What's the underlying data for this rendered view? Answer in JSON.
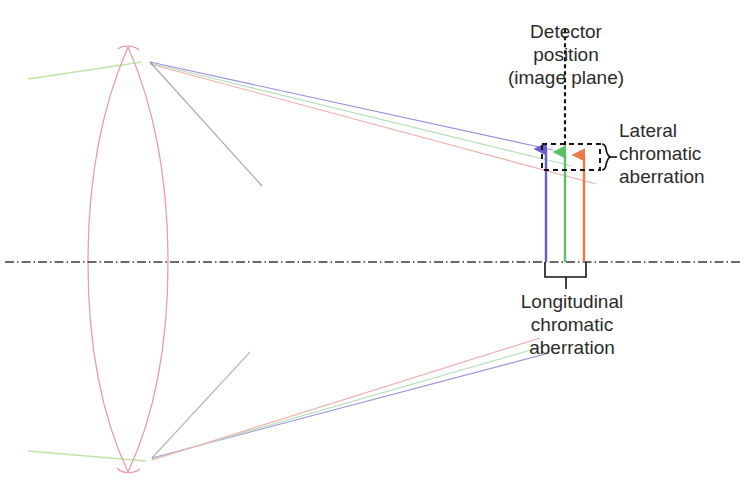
{
  "figure": {
    "title_semantic": "chromatic-aberration-lens-diagram",
    "background_color": "#ffffff"
  },
  "labels": {
    "detector": {
      "lines": [
        "Detector",
        "position",
        "(image plane)"
      ],
      "align": "center"
    },
    "lateral": {
      "lines": [
        "Lateral",
        "chromatic",
        "aberration"
      ],
      "align": "left"
    },
    "longitudinal": {
      "lines": [
        "Longitudinal",
        "chromatic",
        "aberration"
      ],
      "align": "center"
    }
  },
  "colors": {
    "text": "#2b2b2b",
    "lens_outline": "#e8a0a0",
    "optical_axis": "#3a3a3a",
    "detector_line": "#1a1a1a",
    "bracket": "#1a1a1a",
    "ray_blue": "#6a5acd",
    "ray_green": "#5bbf6a",
    "ray_orange": "#f07a46",
    "ray_blue_faint": "#8f86d8",
    "ray_green_faint": "#a8dcae",
    "ray_red_faint": "#e8a0a0",
    "incoming_ray": "#bfe6a8"
  },
  "geometry": {
    "optical_axis_y": 262,
    "lens_center_x": 128,
    "lens_top_y": 47,
    "lens_bottom_y": 472,
    "lens_half_width": 34,
    "detector_x": 565,
    "detector_top_y": 30,
    "detector_bottom_y": 150,
    "focus_crossing_x": 415,
    "focus_crossing_y": 262,
    "arrows": [
      {
        "name": "blue-image-arrow",
        "color_key": "ray_blue",
        "x": 546,
        "tip_y": 143,
        "base_y": 262
      },
      {
        "name": "green-image-arrow",
        "color_key": "ray_green",
        "x": 565,
        "tip_y": 146,
        "base_y": 262
      },
      {
        "name": "orange-image-arrow",
        "color_key": "ray_orange",
        "x": 584,
        "tip_y": 149,
        "base_y": 262
      }
    ],
    "lateral_bracket": {
      "dashed_rect": {
        "x": 542,
        "y": 144,
        "width": 58,
        "height": 26
      },
      "curly_x": 606,
      "curly_top_y": 144,
      "curly_bottom_y": 170
    },
    "longitudinal_bracket": {
      "left_x": 545,
      "right_x": 586,
      "top_y": 262,
      "bottom_y": 278,
      "stem_x": 566,
      "stem_bottom_y": 288
    }
  },
  "rays": {
    "incoming": [
      {
        "name": "upper-incoming-ray",
        "from": [
          28,
          79
        ],
        "to": [
          140,
          62
        ]
      },
      {
        "name": "lower-incoming-ray",
        "from": [
          28,
          451
        ],
        "to": [
          145,
          461
        ]
      }
    ],
    "upper_fan": [
      {
        "name": "upper-blue-ray",
        "color_key": "ray_blue_faint",
        "from": [
          150,
          63
        ],
        "to": [
          553,
          148
        ]
      },
      {
        "name": "upper-green-ray",
        "color_key": "ray_green_faint",
        "from": [
          150,
          64
        ],
        "to": [
          566,
          160
        ]
      },
      {
        "name": "upper-red-ray",
        "color_key": "ray_red_faint",
        "from": [
          150,
          65
        ],
        "to": [
          590,
          178
        ]
      }
    ],
    "lower_fan": [
      {
        "name": "lower-blue-ray",
        "color_key": "ray_blue_faint",
        "from": [
          152,
          458
        ],
        "to": [
          548,
          352
        ]
      },
      {
        "name": "lower-green-ray",
        "color_key": "ray_green_faint",
        "from": [
          152,
          459
        ],
        "to": [
          545,
          347
        ]
      },
      {
        "name": "lower-red-ray",
        "color_key": "ray_red_faint",
        "from": [
          152,
          460
        ],
        "to": [
          540,
          340
        ]
      }
    ]
  }
}
